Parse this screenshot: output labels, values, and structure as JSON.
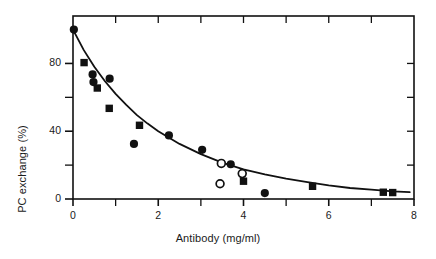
{
  "chart_data": {
    "type": "scatter",
    "title": "",
    "xlabel": "Antibody (mg/ml)",
    "ylabel": "PC exchange (%)",
    "xlim": [
      0,
      8
    ],
    "ylim": [
      0,
      108
    ],
    "grid": false,
    "legend": "none",
    "x_ticks_major": [
      0,
      2,
      4,
      6,
      8
    ],
    "x_ticks_major_labels": [
      "0",
      "2",
      "4",
      "6",
      "8"
    ],
    "x_ticks_minor": [
      1,
      3,
      5,
      7
    ],
    "y_ticks_major": [
      0,
      40,
      80
    ],
    "y_ticks_major_labels": [
      "0",
      "40",
      "80"
    ],
    "y_ticks_minor": [
      20,
      60
    ],
    "series": [
      {
        "name": "filled-circle",
        "marker": "filled-circle",
        "points": [
          {
            "x": 0.02,
            "y": 100.0
          },
          {
            "x": 0.46,
            "y": 73.5
          },
          {
            "x": 0.48,
            "y": 69.0
          },
          {
            "x": 0.86,
            "y": 71.0
          },
          {
            "x": 1.43,
            "y": 32.5
          },
          {
            "x": 2.25,
            "y": 37.5
          },
          {
            "x": 3.03,
            "y": 29.0
          },
          {
            "x": 3.7,
            "y": 20.5
          },
          {
            "x": 4.5,
            "y": 3.5
          }
        ]
      },
      {
        "name": "filled-square",
        "marker": "filled-square",
        "points": [
          {
            "x": 0.26,
            "y": 80.5
          },
          {
            "x": 0.57,
            "y": 65.5
          },
          {
            "x": 0.85,
            "y": 53.5
          },
          {
            "x": 1.56,
            "y": 43.5
          },
          {
            "x": 4.0,
            "y": 10.5
          },
          {
            "x": 5.62,
            "y": 7.5
          },
          {
            "x": 7.28,
            "y": 4.0
          },
          {
            "x": 7.5,
            "y": 3.8
          }
        ]
      },
      {
        "name": "open-circle",
        "marker": "open-circle",
        "points": [
          {
            "x": 3.48,
            "y": 21.0
          },
          {
            "x": 3.97,
            "y": 15.0
          },
          {
            "x": 3.45,
            "y": 9.0
          }
        ]
      }
    ],
    "fit_curve": {
      "name": "exponential-decay-fit",
      "description": "smooth monotonic decreasing curve through the data",
      "points": [
        {
          "x": 0.0,
          "y": 100.0
        },
        {
          "x": 0.25,
          "y": 88.0
        },
        {
          "x": 0.5,
          "y": 78.0
        },
        {
          "x": 0.75,
          "y": 69.5
        },
        {
          "x": 1.0,
          "y": 62.0
        },
        {
          "x": 1.25,
          "y": 55.5
        },
        {
          "x": 1.5,
          "y": 49.5
        },
        {
          "x": 1.75,
          "y": 44.5
        },
        {
          "x": 2.0,
          "y": 40.0
        },
        {
          "x": 2.5,
          "y": 32.5
        },
        {
          "x": 3.0,
          "y": 26.5
        },
        {
          "x": 3.5,
          "y": 21.5
        },
        {
          "x": 4.0,
          "y": 17.5
        },
        {
          "x": 4.5,
          "y": 14.5
        },
        {
          "x": 5.0,
          "y": 12.0
        },
        {
          "x": 5.5,
          "y": 10.0
        },
        {
          "x": 6.0,
          "y": 8.0
        },
        {
          "x": 6.5,
          "y": 6.5
        },
        {
          "x": 7.0,
          "y": 5.5
        },
        {
          "x": 7.5,
          "y": 4.5
        },
        {
          "x": 7.9,
          "y": 4.0
        }
      ]
    },
    "colors": {
      "marker": "#111111",
      "curve": "#111111",
      "axis": "#111111",
      "background": "#ffffff"
    }
  }
}
